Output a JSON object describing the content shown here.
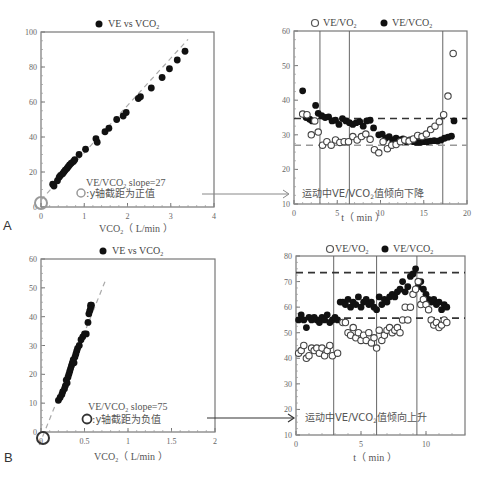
{
  "panels": {
    "A": {
      "label": "A"
    },
    "B": {
      "label": "B"
    }
  },
  "chart_data": [
    {
      "id": "A-left",
      "type": "scatter",
      "legend": [
        "VE vs VCO2"
      ],
      "legend_text": "VE vs VCO",
      "legend_sub": "2",
      "xlabel": "VCO2 (L/min)",
      "xlabel_main": "VCO",
      "xlabel_sub": "2",
      "xlabel_unit": "（ L/min ）",
      "ylabel": "",
      "xlim": [
        0,
        4
      ],
      "ylim": [
        0,
        100
      ],
      "xticks": [
        "0",
        "1",
        "2",
        "3",
        "4"
      ],
      "yticks": [
        "0",
        "20",
        "40",
        "60",
        "80",
        "100"
      ],
      "annotation_slope": "VE/VCO2 slope=27",
      "annotation_slope_main": "VE/VCO",
      "annotation_slope_sub": "2",
      "annotation_slope_tail": " slope=27",
      "annotation_intercept": "y轴截距为正值",
      "fit_line": {
        "slope": 27,
        "intercept": 4,
        "style": "dashed-gray"
      },
      "series": [
        {
          "name": "VE vs VCO2",
          "marker": "filled",
          "x": [
            0.27,
            0.3,
            0.38,
            0.42,
            0.45,
            0.5,
            0.53,
            0.56,
            0.6,
            0.63,
            0.66,
            0.7,
            0.75,
            0.78,
            0.88,
            1.03,
            1.27,
            1.3,
            1.48,
            1.57,
            1.75,
            1.9,
            1.97,
            2.25,
            2.3,
            2.55,
            2.8,
            2.97,
            3.15,
            3.33
          ],
          "y": [
            13,
            12,
            15,
            17,
            18,
            19,
            20,
            21,
            22,
            23,
            24,
            25,
            26,
            27,
            30,
            33,
            39,
            37,
            43,
            45,
            50,
            52,
            54,
            62,
            63,
            68,
            74,
            79,
            84,
            89
          ]
        }
      ]
    },
    {
      "id": "A-right",
      "type": "scatter",
      "legend": [
        "VE/VO2",
        "VE/VCO2"
      ],
      "legend_ve_vo2": "VE/VO",
      "legend_ve_vco2": "VE/VCO",
      "legend_sub": "2",
      "xlabel": "t (min)",
      "xlabel_text": "t（ min ）",
      "xlim": [
        0,
        20
      ],
      "ylim": [
        10,
        60
      ],
      "xticks": [
        "0",
        "5",
        "10",
        "15",
        "20"
      ],
      "yticks": [
        "10",
        "20",
        "30",
        "40",
        "50",
        "60"
      ],
      "vertical_lines": [
        3,
        6.4,
        17.2
      ],
      "hlines": [
        {
          "y": 34.7,
          "style": "dashed-dark"
        },
        {
          "y": 27,
          "style": "dashed-gray"
        }
      ],
      "annotation": "运动中VE/VCO2值倾向下降",
      "annotation_main": "运动中VE/VCO",
      "annotation_sub": "2",
      "annotation_tail": "值倾向下降",
      "series": [
        {
          "name": "VE/VCO2",
          "marker": "filled",
          "x": [
            1,
            1.4,
            1.8,
            2.1,
            2.5,
            2.8,
            3.2,
            3.6,
            4,
            4.4,
            4.8,
            5.2,
            5.6,
            6,
            6.4,
            6.8,
            7.2,
            7.6,
            8,
            8.4,
            8.8,
            9.2,
            9.8,
            10.2,
            10.6,
            11,
            11.4,
            11.8,
            12.2,
            12.6,
            13,
            13.4,
            13.8,
            14.2,
            14.6,
            15,
            15.4,
            15.8,
            16.2,
            16.6,
            17,
            17.4,
            17.8,
            18.2,
            18.5
          ],
          "y": [
            42.7,
            35,
            34.5,
            34,
            38.5,
            36.2,
            35.5,
            35,
            35.2,
            34,
            34.2,
            33,
            34.7,
            34,
            33.5,
            33,
            33.5,
            33.8,
            32.5,
            34,
            34.2,
            32,
            30,
            30.2,
            29,
            29.5,
            28.5,
            29,
            28.5,
            28.8,
            28,
            28.5,
            28,
            27.8,
            27.8,
            28,
            28,
            28.2,
            28.3,
            28.2,
            28.5,
            29,
            29.3,
            29.6,
            34
          ]
        },
        {
          "name": "VE/VO2",
          "marker": "open",
          "x": [
            1,
            1.5,
            2,
            2.4,
            2.8,
            3.3,
            3.8,
            4.3,
            4.8,
            5.3,
            5.8,
            6.3,
            6.8,
            7.3,
            7.8,
            8.3,
            8.8,
            9.3,
            9.8,
            10.3,
            10.8,
            11.3,
            11.8,
            12.3,
            12.8,
            13.3,
            13.8,
            14.3,
            14.8,
            15.3,
            15.8,
            16.3,
            16.8,
            17.3,
            17.8,
            18.4
          ],
          "y": [
            36,
            35.8,
            30,
            34,
            30.8,
            27,
            28,
            27,
            28.5,
            27.8,
            28,
            28,
            29.5,
            28.5,
            29.5,
            30.2,
            28.7,
            25.7,
            24.8,
            28,
            26,
            27,
            27.2,
            28,
            28.5,
            28.2,
            28.8,
            29.8,
            29.5,
            30.2,
            31.5,
            32.5,
            33.8,
            35.8,
            41.2,
            53.5
          ]
        }
      ]
    },
    {
      "id": "B-left",
      "type": "scatter",
      "legend": [
        "VE vs VCO2"
      ],
      "legend_text": "VE vs VCO",
      "legend_sub": "2",
      "xlabel": "VCO2 (L/min)",
      "xlabel_main": "VCO",
      "xlabel_sub": "2",
      "xlabel_unit": "（ L/min ）",
      "xlim": [
        0,
        2
      ],
      "ylim": [
        0,
        60
      ],
      "xticks": [
        "0",
        "0.5",
        "1",
        "1.5",
        "2"
      ],
      "yticks": [
        "0",
        "10",
        "20",
        "30",
        "40",
        "50",
        "60"
      ],
      "annotation_slope": "VE/VCO2 slope=75",
      "annotation_slope_main": "VE/VCO",
      "annotation_slope_sub": "2",
      "annotation_slope_tail": " slope=75",
      "annotation_intercept": "y轴截距为负值",
      "fit_line": {
        "slope": 75,
        "intercept": -3,
        "style": "dashed-gray"
      },
      "series": [
        {
          "name": "VE vs VCO2",
          "marker": "filled",
          "x": [
            0.2,
            0.22,
            0.24,
            0.25,
            0.27,
            0.28,
            0.29,
            0.3,
            0.31,
            0.32,
            0.33,
            0.34,
            0.35,
            0.36,
            0.37,
            0.38,
            0.39,
            0.4,
            0.41,
            0.42,
            0.44,
            0.46,
            0.48,
            0.5,
            0.52,
            0.54,
            0.55,
            0.56,
            0.57,
            0.57,
            0.58
          ],
          "y": [
            11,
            12,
            13,
            14,
            15,
            16,
            18,
            17,
            19,
            20,
            21,
            22,
            23,
            24,
            25,
            24,
            26,
            27,
            28,
            29,
            30,
            32,
            33,
            34,
            34,
            38,
            41,
            42,
            43,
            44,
            44
          ]
        }
      ]
    },
    {
      "id": "B-right",
      "type": "scatter",
      "legend": [
        "VE/VO2",
        "VE/VCO2"
      ],
      "legend_ve_vo2": "VE/VO",
      "legend_ve_vco2": "VE/VCO",
      "legend_sub": "2",
      "xlabel": "t (min)",
      "xlabel_text": "t（ min ）",
      "xlim": [
        0,
        13
      ],
      "ylim": [
        10,
        80
      ],
      "xticks": [
        "0",
        "5",
        "10"
      ],
      "yticks": [
        "10",
        "20",
        "30",
        "40",
        "50",
        "60",
        "70",
        "80"
      ],
      "vertical_lines": [
        2.9,
        6.2,
        9.3
      ],
      "hlines": [
        {
          "y": 73.5,
          "style": "dashed-dark"
        },
        {
          "y": 55.7,
          "style": "dashed-dark"
        }
      ],
      "annotation": "运动中VE/VCO2值倾向上升",
      "annotation_main": "运动中VE/VCO",
      "annotation_sub": "2",
      "annotation_tail": "值倾向上升",
      "series": [
        {
          "name": "VE/VCO2",
          "marker": "filled",
          "x": [
            0.2,
            0.4,
            0.6,
            0.8,
            1,
            1.2,
            1.4,
            1.6,
            1.8,
            2,
            2.2,
            2.4,
            2.6,
            2.8,
            3,
            3.2,
            3.4,
            3.6,
            3.8,
            4,
            4.2,
            4.4,
            4.6,
            4.8,
            5,
            5.2,
            5.4,
            5.6,
            5.8,
            6,
            6.2,
            6.4,
            6.6,
            6.8,
            7,
            7.2,
            7.4,
            7.6,
            7.8,
            8,
            8.2,
            8.4,
            8.6,
            8.8,
            9,
            9.2,
            9.4,
            9.6,
            9.8,
            10,
            10.2,
            10.4,
            10.6,
            10.8,
            11,
            11.2,
            11.4,
            11.6
          ],
          "y": [
            55,
            57,
            55,
            52,
            56,
            55,
            56,
            55,
            54,
            56,
            55,
            57,
            54,
            55,
            56,
            55,
            62,
            62,
            61,
            63,
            60,
            62,
            61,
            64,
            60,
            62,
            63,
            61,
            62,
            60,
            59,
            64,
            61,
            63,
            62,
            64,
            65,
            64,
            66,
            67,
            70,
            66,
            68,
            72,
            73,
            75,
            68,
            70,
            67,
            65,
            63,
            62,
            63,
            61,
            62,
            59,
            61,
            60
          ]
        },
        {
          "name": "VE/VO2",
          "marker": "open",
          "x": [
            0.2,
            0.4,
            0.6,
            0.8,
            1,
            1.2,
            1.4,
            1.6,
            1.8,
            2,
            2.2,
            2.4,
            2.6,
            2.8,
            3.2,
            3.6,
            3.8,
            4,
            4.2,
            4.4,
            4.6,
            4.8,
            5,
            5.2,
            5.4,
            5.6,
            5.8,
            6,
            6.2,
            6.4,
            6.6,
            6.8,
            7,
            7.2,
            7.4,
            7.6,
            7.8,
            8,
            8.2,
            8.4,
            8.6,
            8.8,
            9,
            9.2,
            9.4,
            9.6,
            9.8,
            10,
            10.2,
            10.4,
            10.6,
            10.8,
            11,
            11.2,
            11.4,
            11.6
          ],
          "y": [
            42,
            43,
            45,
            40,
            41,
            44,
            43,
            44,
            42,
            44,
            41,
            43,
            45,
            41,
            42,
            54,
            54,
            50,
            49,
            52,
            48,
            50,
            47,
            49,
            47,
            50,
            46,
            48,
            44,
            51,
            47,
            49,
            51,
            52,
            50,
            51,
            52,
            50,
            55,
            60,
            55,
            60,
            65,
            67,
            70,
            61,
            63,
            61,
            59,
            55,
            53,
            54,
            52,
            53,
            55,
            54,
            50,
            51,
            53
          ]
        }
      ]
    }
  ]
}
